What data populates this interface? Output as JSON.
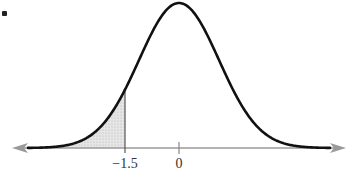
{
  "chart_data": {
    "type": "area",
    "title": "",
    "xlabel": "",
    "ylabel": "",
    "distribution": "normal",
    "mean": 0,
    "sd": 1,
    "shaded_region": {
      "from": "-infinity",
      "to": -1.5
    },
    "tick_labels": [
      "−1.5",
      "0"
    ],
    "tick_values": [
      -1.5,
      0
    ],
    "grid": false,
    "legend": null
  },
  "colors": {
    "curve": "#111111",
    "axis": "#9a9a9a",
    "shade": "#d9d9d9",
    "marker_line": "#555555"
  },
  "labels": {
    "tick_neg": "−1.5",
    "tick_zero": "0"
  }
}
